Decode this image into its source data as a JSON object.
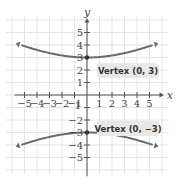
{
  "chart_data": {
    "type": "line",
    "title": "",
    "xlabel": "x",
    "ylabel": "y",
    "xlim": [
      -5.5,
      5.5
    ],
    "ylim": [
      -5.5,
      5.5
    ],
    "grid": true,
    "x_ticks": [
      -5,
      -4,
      -3,
      -2,
      -1,
      1,
      2,
      3,
      4,
      5
    ],
    "y_ticks": [
      -5,
      -4,
      -3,
      -2,
      -1,
      1,
      2,
      3,
      4,
      5
    ],
    "x_tick_labels": [
      "−5",
      "−4",
      "−3",
      "−2",
      "−1",
      "1",
      "2",
      "3",
      "4",
      "5"
    ],
    "y_tick_labels_pos": [
      "1",
      "2",
      "3",
      "4",
      "5"
    ],
    "y_tick_labels_neg": [
      "−2",
      "−3",
      "−4",
      "−5"
    ],
    "origin_label": "1",
    "series": [
      {
        "name": "upper branch",
        "equation": "y = sqrt(9 + x^2 / 4)",
        "vertex": [
          0,
          3
        ],
        "x": [
          -5.2,
          -4,
          -3,
          -2,
          -1,
          0,
          1,
          2,
          3,
          4,
          5.2
        ],
        "y": [
          4.8,
          4.1,
          3.7,
          3.3,
          3.05,
          3,
          3.05,
          3.3,
          3.7,
          4.1,
          4.8
        ]
      },
      {
        "name": "lower branch",
        "equation": "y = -sqrt(9 + x^2 / 4)",
        "vertex": [
          0,
          -3
        ],
        "x": [
          -5.2,
          -4,
          -3,
          -2,
          -1,
          0,
          1,
          2,
          3,
          4,
          5.2
        ],
        "y": [
          -4.8,
          -4.1,
          -3.7,
          -3.3,
          -3.05,
          -3,
          -3.05,
          -3.3,
          -3.7,
          -4.1,
          -4.8
        ]
      }
    ],
    "annotations": [
      {
        "text": "Vertex (0, 3)",
        "point": [
          0,
          3
        ]
      },
      {
        "text": "Vertex (0, −3)",
        "point": [
          0,
          -3
        ]
      }
    ],
    "colors": {
      "curve": "#6b6b6b",
      "grid": "#e4e4e4",
      "axis": "#555555",
      "callout_bg": "#e8e8e8"
    }
  }
}
